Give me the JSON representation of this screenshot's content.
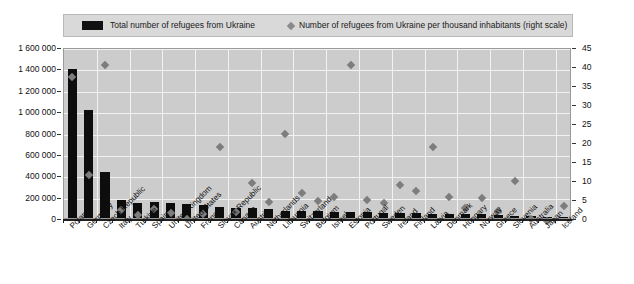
{
  "legend": {
    "bars_label": "Total number of refugees from Ukraine",
    "markers_label": "Number of refugees from Ukraine per thousand inhabitants (right scale)",
    "bar_color": "#111111",
    "marker_color": "#8a8a8a"
  },
  "axes": {
    "left_ticks": [
      "0",
      "200 000",
      "400 000",
      "600 000",
      "800 000",
      "1 000 000",
      "1 200 000",
      "1 400 000",
      "1 600 000"
    ],
    "right_ticks": [
      "0",
      "5",
      "10",
      "15",
      "20",
      "25",
      "30",
      "35",
      "40",
      "45"
    ]
  },
  "chart_data": {
    "type": "bar",
    "title": "",
    "xlabel": "",
    "ylabel": "",
    "ylim": [
      0,
      1600000
    ],
    "y2lim": [
      0,
      45
    ],
    "grid": true,
    "legend_position": "top",
    "categories": [
      "Poland",
      "Germany",
      "Czech Republic",
      "Italy",
      "Türkiye",
      "Spain",
      "United Kingdom",
      "United States",
      "France",
      "Slovak Republic",
      "Canada",
      "Austria",
      "Netherlands",
      "Lithuania",
      "Switzerland",
      "Belgium",
      "Israel",
      "Estonia",
      "Portugal",
      "Sweden",
      "Ireland",
      "Finland",
      "Latvia",
      "Denmark",
      "Hungary",
      "Norway",
      "Greece",
      "Slovenia",
      "Australia",
      "Japan",
      "Iceland"
    ],
    "series": [
      {
        "name": "Total number of refugees from Ukraine",
        "axis": "left",
        "type": "bar",
        "values": [
          1390000,
          1010000,
          430000,
          168000,
          145000,
          150000,
          140000,
          135000,
          118000,
          105000,
          95000,
          90000,
          85000,
          70000,
          65000,
          62000,
          58000,
          52000,
          58000,
          50000,
          48000,
          45000,
          42000,
          38000,
          35000,
          33000,
          28000,
          22000,
          15000,
          9000,
          3000
        ]
      },
      {
        "name": "Number of refugees from Ukraine per thousand inhabitants",
        "axis": "right",
        "type": "scatter",
        "values": [
          38.0,
          12.0,
          41.0,
          2.8,
          1.7,
          3.2,
          2.1,
          0.4,
          1.8,
          19.5,
          2.5,
          10.0,
          4.9,
          23.0,
          7.5,
          5.3,
          6.2,
          41.0,
          5.5,
          4.8,
          9.5,
          8.0,
          19.5,
          6.3,
          3.5,
          6.0,
          2.6,
          10.5,
          0.6,
          0.1,
          4.0
        ]
      }
    ]
  }
}
